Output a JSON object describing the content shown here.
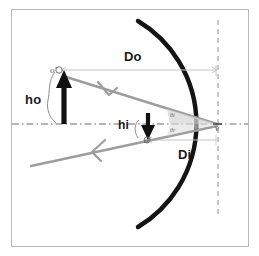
{
  "figure": {
    "frame": {
      "border_color": "#b9b9b9",
      "background_color": "#ffffff"
    },
    "labels": {
      "object_distance": "Do",
      "image_distance": "Di",
      "object_height": "ho",
      "image_height": "hi",
      "object_point": "oʹ",
      "image_point": "oʹ",
      "vertex": "v",
      "angle_incidence": "θi",
      "angle_reflection": "θr"
    },
    "colors": {
      "mirror": "#1a1a1a",
      "ray": "#9a9a9a",
      "axis": "#7a7a7a",
      "arrow": "#111111",
      "measure_line": "#c0c0c0",
      "label": "#1a1a1a",
      "tiny_label": "#555555"
    },
    "geometry": {
      "vertex_x": 218,
      "axis_y": 124,
      "object_base_x": 64,
      "object_tip_y": 73,
      "image_base_x": 148,
      "image_tip_y": 137,
      "mirror_radius": 120
    }
  }
}
